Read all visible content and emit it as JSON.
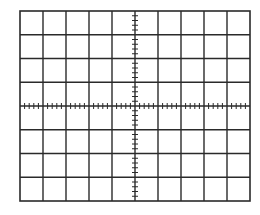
{
  "graticule": {
    "title": "Oscilloscope graticule",
    "divisions_x": 10,
    "divisions_y": 8,
    "subdivisions": 5,
    "left": 20,
    "top": 11,
    "width": 230,
    "height": 190,
    "line_color": "#2a2a2a",
    "background": "#ffffff"
  }
}
